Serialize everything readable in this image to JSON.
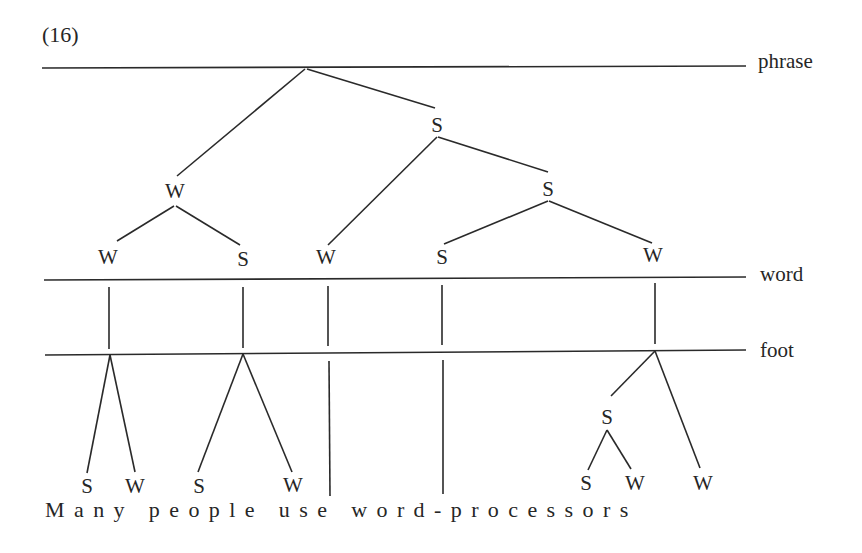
{
  "example_number": "(16)",
  "levels": {
    "phrase": "phrase",
    "word": "word",
    "foot": "foot"
  },
  "phrase_tree": {
    "root_children": [
      "W",
      "S"
    ],
    "s_children": [
      "W",
      "S"
    ],
    "s_s_children": [
      "S",
      "W"
    ],
    "w_children": [
      "W",
      "S"
    ]
  },
  "word_nodes": [
    "W",
    "S",
    "W",
    "S",
    "W"
  ],
  "mid_nodes": {
    "phrase_s": "S",
    "phrase_w": "W",
    "phrase_ss": "S"
  },
  "foot_nodes": {
    "processors_s": "S"
  },
  "syllable_nodes": [
    "S",
    "W",
    "S",
    "W",
    "S",
    "W",
    "W"
  ],
  "sentence": "Many people use word-processors",
  "words": [
    "Many",
    "people",
    "use",
    "word-processors"
  ]
}
